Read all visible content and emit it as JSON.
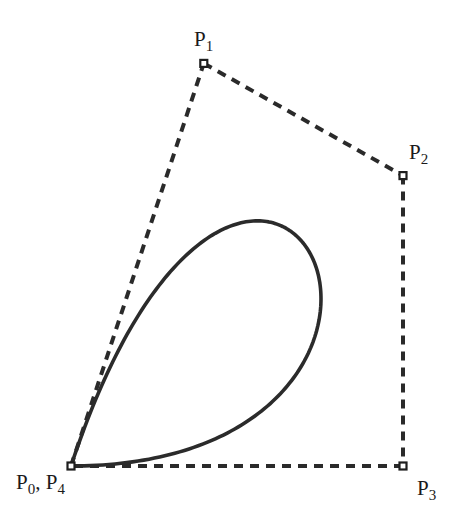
{
  "figure": {
    "curve_type": "bezier",
    "degree": 4,
    "closed": true,
    "colors": {
      "background": "#ffffff",
      "curve": "#2b2b2b",
      "polygon": "#2a2a2a",
      "marker_stroke": "#1e1e1e",
      "label": "#1a1a1a"
    },
    "control_points": [
      {
        "id": "P0",
        "x": 0.0,
        "y": 0.0
      },
      {
        "id": "P1",
        "x": 0.4,
        "y": 1.22
      },
      {
        "id": "P2",
        "x": 1.0,
        "y": 0.88
      },
      {
        "id": "P3",
        "x": 1.0,
        "y": 0.0
      },
      {
        "id": "P4",
        "x": 0.0,
        "y": 0.0
      }
    ],
    "labels": {
      "p0_p4": {
        "main": "P",
        "sub": "0",
        "sep": ", ",
        "main2": "P",
        "sub2": "4"
      },
      "p1": {
        "main": "P",
        "sub": "1"
      },
      "p2": {
        "main": "P",
        "sub": "2"
      },
      "p3": {
        "main": "P",
        "sub": "3"
      }
    }
  }
}
